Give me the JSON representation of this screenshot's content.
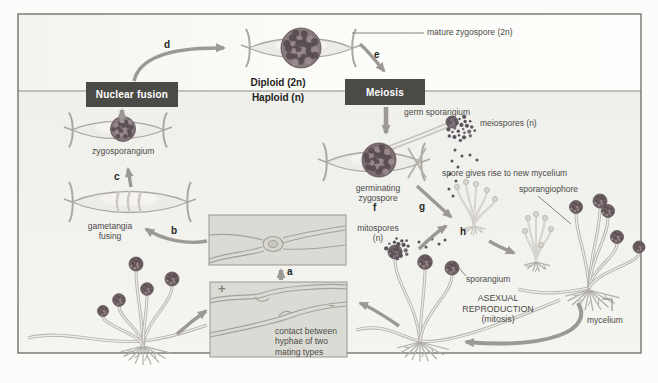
{
  "diagram": {
    "phases": {
      "diploid": "Diploid (2n)",
      "haploid": "Haploid (n)"
    },
    "process_boxes": {
      "nuclear_fusion": "Nuclear fusion",
      "meiosis": "Meiosis"
    },
    "steps": {
      "a": "a",
      "b": "b",
      "c": "c",
      "d": "d",
      "e": "e",
      "f": "f",
      "g": "g",
      "h": "h"
    },
    "labels": {
      "mature_zygospore": "mature zygospore (2n)",
      "germ_sporangium": "germ sporangium",
      "meiospores": "meiospores (n)",
      "zygosporangium": "zygosporangium",
      "gametangia_fusing": "gametangia\nfusing",
      "germinating_zygospore": "germinating\nzygospore",
      "spore_new_mycelium": "spore gives rise to new mycelium",
      "sporangiophore": "sporangiophore",
      "mitospores": "mitospores\n(n)",
      "contact_hyphae": "contact between\nhyphae of two\nmating types",
      "sporangium": "sporangium",
      "asexual_reproduction": "ASEXUAL\nREPRODUCTION\n(mitosis)",
      "mycelium": "mycelium",
      "mating_plus": "+",
      "mating_minus": "−"
    },
    "colors": {
      "process_box_bg": "#4a4a47",
      "process_box_text": "#ffffff",
      "arrow": "#9c9994",
      "diploid_band_bg": "#fafaf6",
      "haploid_band_bg": "#f0f0ec",
      "inset_bg": "#dbdbd5",
      "border": "#696965",
      "sporangium_head": "#6f6063",
      "zygospore_ball": "#877a7d",
      "spore_dot": "#5a525c",
      "hypha_outline": "#b3b1aa"
    }
  }
}
